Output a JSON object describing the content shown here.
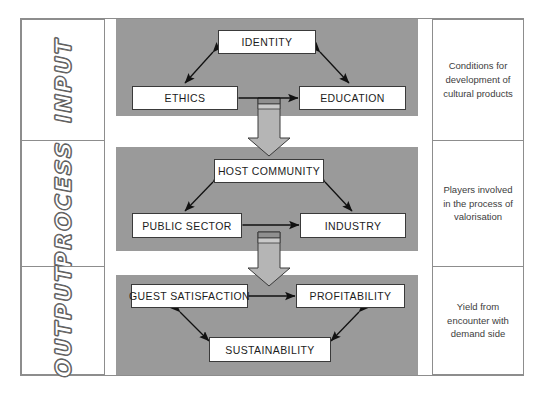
{
  "diagram": {
    "colors": {
      "panel_gray": "#9a9a9a",
      "node_fill": "#ffffff",
      "node_border": "#3a3a3a",
      "frame_border": "#8d8d8d",
      "arrow_stroke": "#111111",
      "block_arrow_fill": "#b5b5b5",
      "block_arrow_stroke": "#3a3a3a",
      "stage_label_outline": "#6b6b6b",
      "desc_text": "#3d3d3d"
    },
    "stage_labels": [
      {
        "id": "input",
        "label": "INPUT"
      },
      {
        "id": "process",
        "label": "PROCESS"
      },
      {
        "id": "output",
        "label": "OUTPUT"
      }
    ],
    "panels": [
      {
        "id": "input-panel",
        "nodes": [
          {
            "id": "identity",
            "label": "IDENTITY"
          },
          {
            "id": "ethics",
            "label": "ETHICS"
          },
          {
            "id": "education",
            "label": "EDUCATION"
          }
        ]
      },
      {
        "id": "process-panel",
        "nodes": [
          {
            "id": "host-community",
            "label": "HOST COMMUNITY"
          },
          {
            "id": "public-sector",
            "label": "PUBLIC SECTOR"
          },
          {
            "id": "industry",
            "label": "INDUSTRY"
          }
        ]
      },
      {
        "id": "output-panel",
        "nodes": [
          {
            "id": "guest-satisfaction",
            "label": "GUEST SATISFACTION"
          },
          {
            "id": "profitability",
            "label": "PROFITABILITY"
          },
          {
            "id": "sustainability",
            "label": "SUSTAINABILITY"
          }
        ]
      }
    ],
    "descriptions": [
      {
        "id": "input-desc",
        "text": "Conditions for development of cultural products"
      },
      {
        "id": "process-desc",
        "text": "Players involved in the process of valorisation"
      },
      {
        "id": "output-desc",
        "text": "Yield from encounter with demand side"
      }
    ],
    "connectors": [
      {
        "id": "input-to-process",
        "type": "block-arrow-down"
      },
      {
        "id": "process-to-output",
        "type": "block-arrow-down"
      }
    ],
    "relations": [
      {
        "id": "identity-ethics",
        "from": "identity",
        "to": "ethics",
        "style": "double-headed"
      },
      {
        "id": "identity-education",
        "from": "identity",
        "to": "education",
        "style": "double-headed"
      },
      {
        "id": "ethics-education",
        "from": "ethics",
        "to": "education",
        "style": "double-headed"
      },
      {
        "id": "host-public",
        "from": "host-community",
        "to": "public-sector",
        "style": "double-headed"
      },
      {
        "id": "host-industry",
        "from": "host-community",
        "to": "industry",
        "style": "double-headed"
      },
      {
        "id": "public-industry",
        "from": "public-sector",
        "to": "industry",
        "style": "double-headed"
      },
      {
        "id": "guest-profit",
        "from": "guest-satisfaction",
        "to": "profitability",
        "style": "double-headed"
      },
      {
        "id": "guest-sustain",
        "from": "guest-satisfaction",
        "to": "sustainability",
        "style": "double-headed"
      },
      {
        "id": "profit-sustain",
        "from": "profitability",
        "to": "sustainability",
        "style": "double-headed"
      }
    ]
  }
}
